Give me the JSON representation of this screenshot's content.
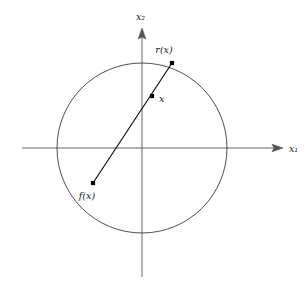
{
  "figure": {
    "name": "retraction-diagram",
    "background_color": "#ffffff",
    "stroke_color": "#3a3a3a",
    "axis_color": "#555555",
    "point_color": "#000000",
    "width": 307,
    "height": 285
  },
  "axes": {
    "horizontal": {
      "label": "x₁",
      "label_x": 289,
      "label_y": 152,
      "x_start": 22,
      "x_end": 283,
      "y": 148
    },
    "vertical": {
      "label": "x₂",
      "label_x": 136,
      "label_y": 20,
      "y_start": 28,
      "y_end": 277,
      "x": 142
    },
    "origin": {
      "x": 142,
      "y": 148
    }
  },
  "circle": {
    "name": "unit-disk-boundary",
    "cx": 142,
    "cy": 148,
    "r": 85
  },
  "points": [
    {
      "id": "r-of-x",
      "label": "r(x)",
      "x": 172,
      "y": 63,
      "label_x": 164,
      "label_y": 53,
      "label_anchor": "middle"
    },
    {
      "id": "x",
      "label": "x",
      "x": 152,
      "y": 96,
      "label_x": 159,
      "label_y": 102,
      "label_anchor": "start"
    },
    {
      "id": "f-of-x",
      "label": "f(x)",
      "x": 93,
      "y": 183,
      "label_x": 87,
      "label_y": 199,
      "label_anchor": "middle"
    }
  ],
  "ray": {
    "name": "ray-from-f-to-r",
    "from": {
      "x": 93,
      "y": 183
    },
    "to": {
      "x": 172,
      "y": 63
    }
  }
}
